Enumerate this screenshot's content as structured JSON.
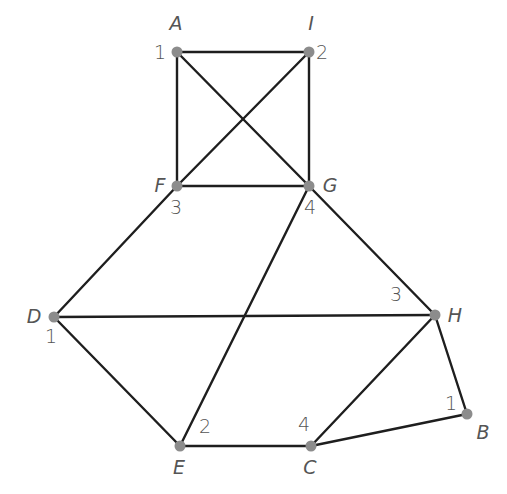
{
  "diagram": {
    "type": "graph",
    "nodes": [
      {
        "id": "A",
        "label": "A",
        "number": "1",
        "x": 177,
        "y": 52,
        "label_pos": [
          176,
          30
        ],
        "number_pos": [
          160,
          59
        ]
      },
      {
        "id": "I",
        "label": "I",
        "number": "2",
        "x": 309,
        "y": 52,
        "label_pos": [
          311,
          30
        ],
        "number_pos": [
          322,
          59
        ]
      },
      {
        "id": "F",
        "label": "F",
        "number": "3",
        "x": 177,
        "y": 186,
        "label_pos": [
          160,
          192
        ],
        "number_pos": [
          176,
          214
        ]
      },
      {
        "id": "G",
        "label": "G",
        "number": "4",
        "x": 309,
        "y": 186,
        "label_pos": [
          330,
          192
        ],
        "number_pos": [
          310,
          214
        ]
      },
      {
        "id": "D",
        "label": "D",
        "number": "1",
        "x": 54,
        "y": 317,
        "label_pos": [
          34,
          323
        ],
        "number_pos": [
          51,
          343
        ]
      },
      {
        "id": "H",
        "label": "H",
        "number": "3",
        "x": 435,
        "y": 315,
        "label_pos": [
          455,
          322
        ],
        "number_pos": [
          396,
          301
        ]
      },
      {
        "id": "B",
        "label": "B",
        "number": "1",
        "x": 467,
        "y": 414,
        "label_pos": [
          483,
          439
        ],
        "number_pos": [
          451,
          410
        ]
      },
      {
        "id": "E",
        "label": "E",
        "number": "2",
        "x": 180,
        "y": 446,
        "label_pos": [
          179,
          474
        ],
        "number_pos": [
          205,
          433
        ]
      },
      {
        "id": "C",
        "label": "C",
        "number": "4",
        "x": 311,
        "y": 446,
        "label_pos": [
          310,
          474
        ],
        "number_pos": [
          304,
          431
        ]
      }
    ],
    "edges": [
      [
        "A",
        "I"
      ],
      [
        "A",
        "F"
      ],
      [
        "A",
        "G"
      ],
      [
        "I",
        "F"
      ],
      [
        "I",
        "G"
      ],
      [
        "F",
        "G"
      ],
      [
        "F",
        "D"
      ],
      [
        "G",
        "E"
      ],
      [
        "G",
        "H"
      ],
      [
        "D",
        "H"
      ],
      [
        "D",
        "E"
      ],
      [
        "E",
        "C"
      ],
      [
        "C",
        "H"
      ],
      [
        "C",
        "B"
      ],
      [
        "H",
        "B"
      ]
    ],
    "colors": {
      "edge": "#1e1e1e",
      "node": "#8c8c8c",
      "text": "#555555",
      "background": "#ffffff"
    }
  }
}
